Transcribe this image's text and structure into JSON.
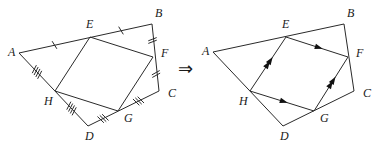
{
  "figure": {
    "implies_symbol": "⇒",
    "left": {
      "vertices": {
        "A": [
          19,
          53
        ],
        "E": [
          90,
          37
        ],
        "B": [
          152,
          24
        ],
        "F": [
          153,
          57
        ],
        "C": [
          159,
          91
        ],
        "G": [
          118,
          111
        ],
        "D": [
          88,
          126
        ],
        "H": [
          55,
          91
        ]
      },
      "labels": [
        {
          "id": "A",
          "text": "A"
        },
        {
          "id": "E",
          "text": "E"
        },
        {
          "id": "B",
          "text": "B"
        },
        {
          "id": "F",
          "text": "F"
        },
        {
          "id": "C",
          "text": "C"
        },
        {
          "id": "G",
          "text": "G"
        },
        {
          "id": "D",
          "text": "D"
        },
        {
          "id": "H",
          "text": "H"
        }
      ],
      "outer_quadrilateral": [
        "A",
        "B",
        "C",
        "D"
      ],
      "inner_quadrilateral": [
        "E",
        "F",
        "G",
        "H"
      ],
      "equal_segment_marks": [
        {
          "segment": [
            "A",
            "E"
          ],
          "ticks": 1
        },
        {
          "segment": [
            "E",
            "B"
          ],
          "ticks": 1
        },
        {
          "segment": [
            "B",
            "F"
          ],
          "ticks": 2
        },
        {
          "segment": [
            "F",
            "C"
          ],
          "ticks": 2
        },
        {
          "segment": [
            "C",
            "G"
          ],
          "ticks": 3
        },
        {
          "segment": [
            "G",
            "D"
          ],
          "ticks": 3
        },
        {
          "segment": [
            "D",
            "H"
          ],
          "ticks": 4
        },
        {
          "segment": [
            "H",
            "A"
          ],
          "ticks": 4
        }
      ]
    },
    "right": {
      "vertices": {
        "A": [
          213,
          52
        ],
        "E": [
          286,
          37
        ],
        "B": [
          344,
          24
        ],
        "F": [
          348,
          57
        ],
        "C": [
          354,
          91
        ],
        "G": [
          314,
          111
        ],
        "D": [
          283,
          126
        ],
        "H": [
          250,
          91
        ]
      },
      "labels": [
        {
          "id": "A",
          "text": "A"
        },
        {
          "id": "E",
          "text": "E"
        },
        {
          "id": "B",
          "text": "B"
        },
        {
          "id": "F",
          "text": "F"
        },
        {
          "id": "C",
          "text": "C"
        },
        {
          "id": "G",
          "text": "G"
        },
        {
          "id": "D",
          "text": "D"
        },
        {
          "id": "H",
          "text": "H"
        }
      ],
      "outer_quadrilateral": [
        "A",
        "B",
        "C",
        "D"
      ],
      "inner_quadrilateral": [
        "E",
        "F",
        "G",
        "H"
      ],
      "parallel_arrows": [
        {
          "segment": [
            "E",
            "F"
          ],
          "arrows": 1
        },
        {
          "segment": [
            "H",
            "G"
          ],
          "arrows": 1
        },
        {
          "segment": [
            "H",
            "E"
          ],
          "arrows": 2
        },
        {
          "segment": [
            "G",
            "F"
          ],
          "arrows": 2
        }
      ]
    }
  }
}
